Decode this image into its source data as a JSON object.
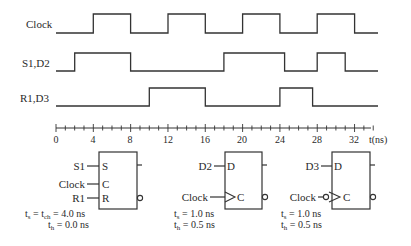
{
  "signals": [
    {
      "name": "Clock",
      "label": "Clock",
      "initial": 0,
      "transitions": [
        4,
        8,
        12,
        16,
        20,
        24,
        28,
        32
      ]
    },
    {
      "name": "S1,D2",
      "label": "S1,D2",
      "initial": 0,
      "transitions": [
        2,
        8,
        18,
        24.5,
        28,
        31
      ]
    },
    {
      "name": "R1,D3",
      "label": "R1,D3",
      "initial": 0,
      "transitions": [
        10,
        16,
        24,
        27.5
      ]
    }
  ],
  "axis": {
    "start": 0,
    "end": 34,
    "minor_step": 1,
    "major_step": 4,
    "tick_labels": [
      "0",
      "4",
      "8",
      "12",
      "16",
      "20",
      "24",
      "28",
      "32"
    ],
    "unit_label": "t(ns)"
  },
  "flipflops": [
    {
      "type": "SR",
      "inputs": [
        {
          "wire": "S1",
          "pin": "S"
        },
        {
          "wire": "Clock",
          "pin": "C"
        },
        {
          "wire": "R1",
          "pin": "R"
        }
      ],
      "clock_edge": "level",
      "timing": [
        "t",
        "s",
        " = t",
        "ch",
        " = 4.0 ns",
        "t",
        "h",
        " = 0.0 ns"
      ],
      "timing_lines": [
        "ts = tch = 4.0 ns",
        "th = 0.0 ns"
      ]
    },
    {
      "type": "D",
      "inputs": [
        {
          "wire": "D2",
          "pin": "D"
        },
        {
          "wire": "Clock",
          "pin": "C"
        }
      ],
      "clock_edge": "rising",
      "timing_lines": [
        "ts = 1.0 ns",
        "th = 0.5 ns"
      ]
    },
    {
      "type": "D",
      "inputs": [
        {
          "wire": "D3",
          "pin": "D"
        },
        {
          "wire": "Clock",
          "pin": "C"
        }
      ],
      "clock_edge": "falling",
      "timing_lines": [
        "ts = 1.0 ns",
        "th = 0.5 ns"
      ]
    }
  ],
  "text": {
    "sig0": "Clock",
    "sig1": "S1,D2",
    "sig2": "R1,D3",
    "t0": "0",
    "t4": "4",
    "t8": "8",
    "t12": "12",
    "t16": "16",
    "t20": "20",
    "t24": "24",
    "t28": "28",
    "t32": "32",
    "unit": "t(ns)",
    "ff1_S_wire": "S1",
    "ff1_C_wire": "Clock",
    "ff1_R_wire": "R1",
    "ff1_S": "S",
    "ff1_C": "C",
    "ff1_R": "R",
    "ff2_D_wire": "D2",
    "ff2_C_wire": "Clock",
    "ff2_D": "D",
    "ff2_C": "C",
    "ff3_D_wire": "D3",
    "ff3_C_wire": "Clock",
    "ff3_D": "D",
    "ff3_C": "C",
    "ff1_ts_a": "t",
    "ff1_ts_sub": "s",
    "ff1_ts_b": " = t",
    "ff1_ts_sub2": "ch",
    "ff1_ts_c": " = 4.0 ns",
    "ff1_th_a": "t",
    "ff1_th_sub": "h",
    "ff1_th_b": " = 0.0 ns",
    "ff2_ts_a": "t",
    "ff2_ts_sub": "s",
    "ff2_ts_b": " = 1.0 ns",
    "ff2_th_a": "t",
    "ff2_th_sub": "h",
    "ff2_th_b": " = 0.5 ns",
    "ff3_ts_a": "t",
    "ff3_ts_sub": "s",
    "ff3_ts_b": " = 1.0 ns",
    "ff3_th_a": "t",
    "ff3_th_sub": "h",
    "ff3_th_b": " = 0.5 ns"
  }
}
